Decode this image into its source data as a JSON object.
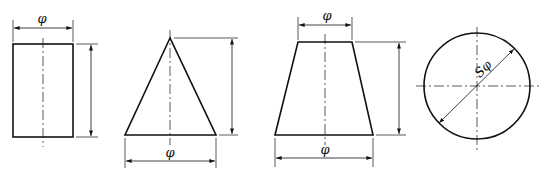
{
  "diagram": {
    "shapes": [
      {
        "name": "cylinder",
        "dimension_labels": {
          "diameter": "φ"
        }
      },
      {
        "name": "cone",
        "dimension_labels": {
          "base_diameter": "φ"
        }
      },
      {
        "name": "frustum",
        "dimension_labels": {
          "top_diameter": "φ",
          "bottom_diameter": "φ"
        }
      },
      {
        "name": "sphere",
        "dimension_labels": {
          "sphere_diameter": "Sφ"
        }
      }
    ],
    "colors": {
      "line": "#111111",
      "background": "#ffffff"
    }
  }
}
